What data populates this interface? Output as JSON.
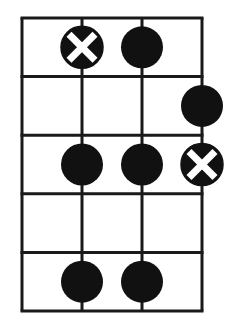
{
  "diagram": {
    "type": "fretboard-pattern",
    "strings": 4,
    "frets": 5,
    "colors": {
      "line": "#1a1a1a",
      "dot": "#111111",
      "mark": "#ffffff",
      "background": "#ffffff"
    },
    "grid": {
      "x0": 22,
      "y0": 18,
      "col_spacing": 60,
      "row_height": 58.6
    },
    "dots": [
      {
        "string": 1,
        "fret": 1,
        "type": "x"
      },
      {
        "string": 2,
        "fret": 1,
        "type": "solid"
      },
      {
        "string": 3,
        "fret": 2,
        "type": "solid"
      },
      {
        "string": 1,
        "fret": 3,
        "type": "solid"
      },
      {
        "string": 2,
        "fret": 3,
        "type": "solid"
      },
      {
        "string": 3,
        "fret": 3,
        "type": "x"
      },
      {
        "string": 1,
        "fret": 5,
        "type": "solid"
      },
      {
        "string": 2,
        "fret": 5,
        "type": "solid"
      }
    ]
  }
}
